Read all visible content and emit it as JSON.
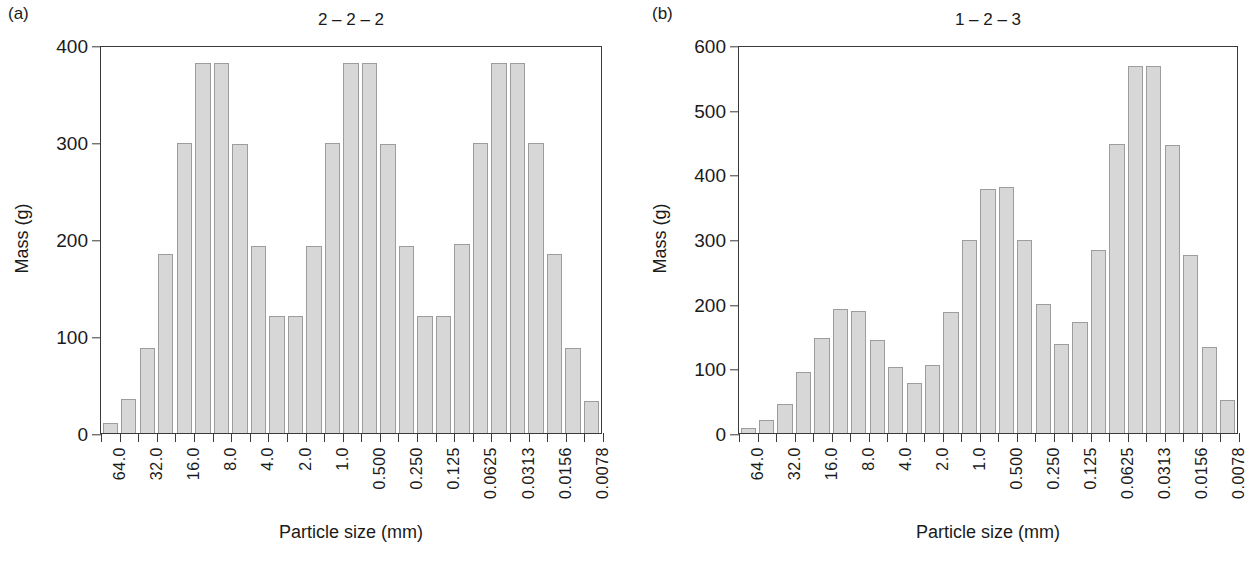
{
  "figure": {
    "panels": [
      {
        "panel_letter": "(a)",
        "title": "2 – 2 – 2",
        "chart_data": {
          "type": "bar",
          "title": "2 – 2 – 2",
          "xlabel": "Particle size (mm)",
          "ylabel": "Mass (g)",
          "ylim": [
            0,
            400
          ],
          "yticks": [
            0,
            100,
            200,
            300,
            400
          ],
          "ytick_labels": [
            "0",
            "100",
            "200",
            "300",
            "400"
          ],
          "grid": false,
          "legend": "none",
          "x_axis_note": "Labels appear on every other tick; bars sit between ticks.",
          "tick_labels": [
            "64.0",
            "32.0",
            "16.0",
            "8.0",
            "4.0",
            "2.0",
            "1.0",
            "0.500",
            "0.250",
            "0.125",
            "0.0625",
            "0.0313",
            "0.0156",
            "0.0078"
          ],
          "categories": [
            "64.0",
            "",
            "32.0",
            "",
            "16.0",
            "",
            "8.0",
            "",
            "4.0",
            "",
            "2.0",
            "",
            "1.0",
            "",
            "0.500",
            "",
            "0.250",
            "",
            "0.125",
            "",
            "0.0625",
            "",
            "0.0313",
            "",
            "0.0156",
            "",
            "0.0078"
          ],
          "values": [
            10,
            35,
            88,
            185,
            301,
            383,
            383,
            300,
            194,
            121,
            121,
            194,
            301,
            383,
            383,
            300,
            194,
            121,
            121,
            196,
            301,
            383,
            383,
            301,
            185,
            88,
            33
          ]
        }
      },
      {
        "panel_letter": "(b)",
        "title": "1 – 2 – 3",
        "chart_data": {
          "type": "bar",
          "title": "1 – 2 – 3",
          "xlabel": "Particle size (mm)",
          "ylabel": "Mass (g)",
          "ylim": [
            0,
            600
          ],
          "yticks": [
            0,
            100,
            200,
            300,
            400,
            500,
            600
          ],
          "ytick_labels": [
            "0",
            "100",
            "200",
            "300",
            "400",
            "500",
            "600"
          ],
          "grid": false,
          "legend": "none",
          "x_axis_note": "Labels appear on every other tick; bars sit between ticks.",
          "tick_labels": [
            "64.0",
            "32.0",
            "16.0",
            "8.0",
            "4.0",
            "2.0",
            "1.0",
            "0.500",
            "0.250",
            "0.125",
            "0.0625",
            "0.0313",
            "0.0156",
            "0.0078"
          ],
          "categories": [
            "64.0",
            "",
            "32.0",
            "",
            "16.0",
            "",
            "8.0",
            "",
            "4.0",
            "",
            "2.0",
            "",
            "1.0",
            "",
            "0.500",
            "",
            "0.250",
            "",
            "0.125",
            "",
            "0.0625",
            "",
            "0.0313",
            "",
            "0.0156",
            "",
            "0.0078"
          ],
          "values": [
            8,
            20,
            45,
            95,
            148,
            192,
            190,
            145,
            103,
            78,
            105,
            188,
            300,
            380,
            383,
            300,
            200,
            138,
            173,
            285,
            450,
            570,
            570,
            447,
            277,
            133,
            52
          ]
        }
      }
    ],
    "colors": {
      "bar_fill": "#d7d7d7",
      "bar_stroke": "#9d9d9d",
      "axis": "#3a3a3a",
      "text": "#1a1a1a",
      "background": "#ffffff"
    }
  }
}
